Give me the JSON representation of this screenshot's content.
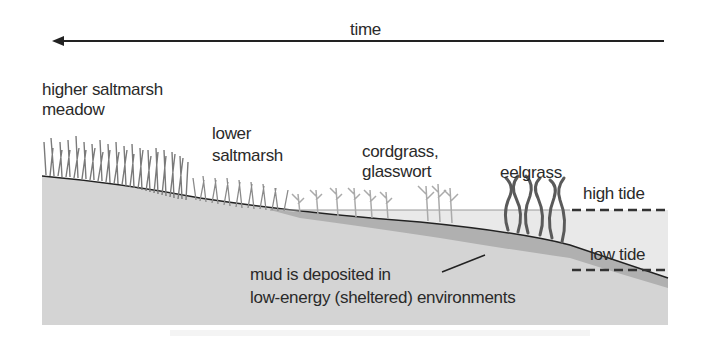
{
  "title": "time",
  "labels": {
    "higher_saltmarsh_line1": "higher saltmarsh",
    "higher_saltmarsh_line2": "meadow",
    "lower_saltmarsh_line1": "lower",
    "lower_saltmarsh_line2": "saltmarsh",
    "cordgrass_line1": "cordgrass,",
    "cordgrass_line2": "glasswort",
    "eelgrass": "eelgrass",
    "high_tide": "high tide",
    "low_tide": "low tide",
    "mud_line1": "mud is deposited in",
    "mud_line2": "low-energy (sheltered) environments"
  },
  "colors": {
    "ground": "#d4d4d4",
    "mud": "#b0b0b0",
    "water": "#e6e6e6",
    "vegetation_dark": "#7a7a7a",
    "vegetation_light": "#a8a8a8",
    "eelgrass": "#5a5a5a",
    "line": "#222222"
  }
}
